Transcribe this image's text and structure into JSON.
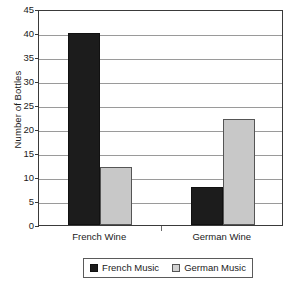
{
  "chart_data": {
    "type": "bar",
    "title": "",
    "xlabel": "",
    "ylabel": "Number of Bottles",
    "categories": [
      "French Wine",
      "German Wine"
    ],
    "series": [
      {
        "name": "French Music",
        "values": [
          40,
          8
        ],
        "color": "#1c1c1c"
      },
      {
        "name": "German Music",
        "values": [
          12,
          22
        ],
        "color": "#c8c8c8"
      }
    ],
    "ylim": [
      0,
      45
    ],
    "ytick_labels": [
      "45",
      "40",
      "35",
      "30",
      "25",
      "20",
      "15",
      "10",
      "5",
      "0"
    ],
    "ytick_values": [
      45,
      40,
      35,
      30,
      25,
      20,
      15,
      10,
      5,
      0
    ],
    "grid": true,
    "legend_position": "bottom"
  },
  "legend": {
    "entries": [
      {
        "label": "French Music"
      },
      {
        "label": "German Music"
      }
    ]
  }
}
